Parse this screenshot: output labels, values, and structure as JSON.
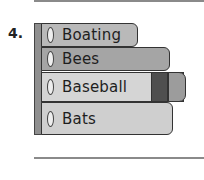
{
  "question": {
    "number": "4."
  },
  "books": [
    {
      "label": "Boating",
      "color": "#b9b9b9"
    },
    {
      "label": "Bees",
      "color": "#a5a5a5"
    },
    {
      "label": "Baseball",
      "color": "#d5d5d5",
      "bands": [
        "#4f4f4f",
        "#9c9c9c"
      ]
    },
    {
      "label": "Bats",
      "color": "#cfcfcf"
    }
  ],
  "answer_line": {
    "value": ""
  }
}
